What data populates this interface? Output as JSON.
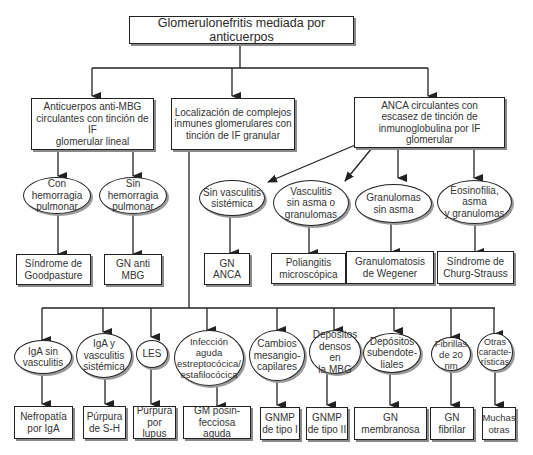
{
  "diagram": {
    "title": "Glomerulonefritis mediada por anticuerpos",
    "level1": {
      "anti_mbg": "Anticuerpos anti-MBG\ncirculantes con tinción de IF\nglomerular lineal",
      "immune_complex": "Localización de complejos\ninmunes glomerulares con\ntinción de IF granular",
      "anca": "ANCA circulantes con\nescasez de tinción de\ninmunoglobulina por IF glomerular"
    },
    "anti_mbg_branch": {
      "conditions": [
        "Con hemorragia\npulmonar",
        "Sin hemorragia\npulmonar"
      ],
      "outcomes": [
        "Síndrome de\nGoodpasture",
        "GN anti\nMBG"
      ]
    },
    "anca_branch": {
      "conditions": [
        "Sin vasculitis\nsistémica",
        "Vasculitis\nsin asma o\ngranulomas",
        "Granulomas\nsin asma",
        "Eosinofilia, asma\ny granulomas"
      ],
      "outcomes": [
        "GN\nANCA",
        "Poliangitis\nmicroscópica",
        "Granulomatosis\nde Wegener",
        "Síndrome de\nChurg-Strauss"
      ]
    },
    "immune_complex_branch": {
      "conditions": [
        "IgA sin\nvasculitis",
        "IgA y\nvasculitis\nsistémica",
        "LES",
        "Infección\naguda\nestreptocócica/\nestafilocócica",
        "Cambios\nmesangio-\ncapilares",
        "Depósitos\ndensos en\nla MBG",
        "Depósitos\nsubendote-\nliales",
        "Fibrillas\nde 20 nm",
        "Otras\ncaracte-\nrísticas"
      ],
      "outcomes": [
        "Nefropatía\npor IgA",
        "Púrpura\nde S-H",
        "Púrpura\npor lupus",
        "GM posin-\nfecciosa aguda",
        "GNMP\nde tipo I",
        "GNMP\nde tipo II",
        "GN\nmembranosa",
        "GN\nfibrilar",
        "Muchas\notras"
      ]
    },
    "colors": {
      "line": "#222222",
      "shadow": "#8a8a8a",
      "background": "#ffffff"
    }
  }
}
